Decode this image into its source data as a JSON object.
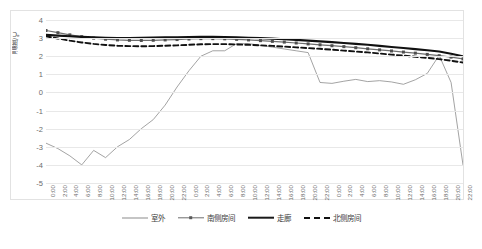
{
  "chart_data": {
    "type": "line",
    "title": "",
    "xlabel": "",
    "ylabel": "温度/℃",
    "ylim": [
      -5,
      4
    ],
    "ytick_labels": [
      "4",
      "3",
      "2",
      "1",
      "0",
      "-1",
      "-2",
      "-3",
      "-4",
      "-5"
    ],
    "ytick_values": [
      4,
      3,
      2,
      1,
      0,
      -1,
      -2,
      -3,
      -4,
      -5
    ],
    "grid": true,
    "legend_position": "bottom",
    "x": [
      "0:00",
      "2:00",
      "4:00",
      "6:00",
      "8:00",
      "10:00",
      "12:00",
      "14:00",
      "16:00",
      "18:00",
      "20:00",
      "22:00",
      "0:00",
      "2:00",
      "4:00",
      "6:00",
      "8:00",
      "10:00",
      "12:00",
      "14:00",
      "16:00",
      "18:00",
      "20:00",
      "22:00",
      "0:00",
      "2:00",
      "4:00",
      "6:00",
      "8:00",
      "10:00",
      "12:00",
      "14:00",
      "16:00",
      "18:00",
      "20:00",
      "22:00"
    ],
    "series": [
      {
        "name": "室外",
        "style": "thin-solid",
        "color": "#8c8c8c",
        "values": [
          -2.8,
          -3.1,
          -3.5,
          -4.0,
          -3.2,
          -3.6,
          -3.0,
          -2.6,
          -2.0,
          -1.5,
          -0.7,
          0.3,
          1.2,
          2.0,
          2.3,
          2.3,
          2.7,
          2.7,
          2.6,
          2.5,
          2.4,
          2.3,
          2.2,
          0.55,
          0.5,
          0.62,
          0.72,
          0.6,
          0.65,
          0.58,
          0.45,
          0.7,
          1.05,
          2.05,
          0.55,
          -4.0
        ]
      },
      {
        "name": "南侧房间",
        "style": "marker-line",
        "color": "#6e6e6e",
        "values": [
          3.42,
          3.3,
          3.18,
          3.08,
          3.0,
          2.94,
          2.9,
          2.88,
          2.87,
          2.88,
          2.9,
          2.92,
          2.95,
          2.97,
          2.97,
          2.96,
          2.93,
          2.9,
          2.86,
          2.82,
          2.78,
          2.73,
          2.68,
          2.63,
          2.58,
          2.53,
          2.47,
          2.41,
          2.35,
          2.29,
          2.23,
          2.17,
          2.1,
          2.03,
          1.95,
          1.85
        ]
      },
      {
        "name": "走廊",
        "style": "thick-solid",
        "color": "#111111",
        "values": [
          3.18,
          3.14,
          3.1,
          3.07,
          3.04,
          3.02,
          3.01,
          3.01,
          3.02,
          3.03,
          3.04,
          3.05,
          3.06,
          3.07,
          3.07,
          3.06,
          3.04,
          3.02,
          3.0,
          2.97,
          2.94,
          2.9,
          2.86,
          2.82,
          2.78,
          2.73,
          2.68,
          2.63,
          2.57,
          2.51,
          2.45,
          2.39,
          2.33,
          2.26,
          2.14,
          2.0
        ]
      },
      {
        "name": "北侧房间",
        "style": "dashed",
        "color": "#111111",
        "values": [
          3.1,
          2.98,
          2.86,
          2.76,
          2.68,
          2.62,
          2.58,
          2.56,
          2.55,
          2.56,
          2.58,
          2.6,
          2.63,
          2.66,
          2.67,
          2.67,
          2.65,
          2.63,
          2.6,
          2.57,
          2.53,
          2.49,
          2.45,
          2.41,
          2.36,
          2.31,
          2.26,
          2.21,
          2.15,
          2.09,
          2.03,
          1.97,
          1.91,
          1.84,
          1.75,
          1.65
        ]
      }
    ]
  },
  "caption": ""
}
